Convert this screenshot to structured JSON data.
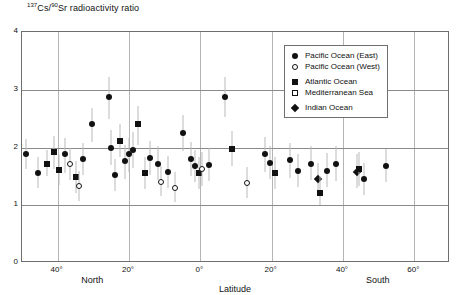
{
  "chart_data": {
    "type": "scatter",
    "title": "137Cs/90Sr radioactivity ratio",
    "title_parts": {
      "sup1": "137",
      "iso1": "Cs/",
      "sup2": "90",
      "iso2": "Sr radioactivity ratio"
    },
    "xlabel": "Latitude",
    "ylabel": "",
    "xlim": [
      50,
      -70
    ],
    "ylim": [
      0,
      4
    ],
    "grid": true,
    "y_ticks": [
      4,
      3,
      2,
      1,
      0
    ],
    "y_tick_labels": [
      "4",
      "3",
      "2",
      "1",
      "0"
    ],
    "x_ticks": [
      40,
      20,
      0,
      -20,
      -40,
      -60
    ],
    "x_tick_labels": [
      "40°",
      "20°",
      "0°",
      "20°",
      "40°",
      "60°"
    ],
    "hemisphere_labels": [
      {
        "text": "North",
        "x": 30
      },
      {
        "text": "South",
        "x": -50
      }
    ],
    "legend": {
      "position": "upper-right",
      "entries": [
        {
          "label": "Pacific Ocean (East)",
          "marker": "circle-filled"
        },
        {
          "label": "Pacific Ocean (West)",
          "marker": "circle-open"
        },
        {
          "label": "Atlantic Ocean",
          "marker": "square-filled"
        },
        {
          "label": "Mediterranean Sea",
          "marker": "square-open"
        },
        {
          "label": "Indian Ocean",
          "marker": "diamond-filled"
        }
      ]
    },
    "points": [
      {
        "x": 49.0,
        "y": 1.88,
        "lo": 1.62,
        "hi": 2.14,
        "marker": "circle-filled"
      },
      {
        "x": 45.5,
        "y": 1.56,
        "lo": 1.3,
        "hi": 1.84,
        "marker": "circle-filled"
      },
      {
        "x": 43.0,
        "y": 1.72,
        "lo": 1.5,
        "hi": 1.96,
        "marker": "square-filled"
      },
      {
        "x": 41.0,
        "y": 1.93,
        "lo": 1.62,
        "hi": 2.2,
        "marker": "square-filled"
      },
      {
        "x": 39.5,
        "y": 1.61,
        "lo": 1.35,
        "hi": 1.88,
        "marker": "square-filled"
      },
      {
        "x": 38.0,
        "y": 1.88,
        "lo": 1.56,
        "hi": 2.16,
        "marker": "circle-filled"
      },
      {
        "x": 36.5,
        "y": 1.72,
        "lo": 1.44,
        "hi": 2.0,
        "marker": "circle-open"
      },
      {
        "x": 35.0,
        "y": 1.49,
        "lo": 1.22,
        "hi": 1.76,
        "marker": "square-filled"
      },
      {
        "x": 33.0,
        "y": 1.8,
        "lo": 1.52,
        "hi": 2.08,
        "marker": "circle-filled"
      },
      {
        "x": 34.0,
        "y": 1.33,
        "lo": 1.08,
        "hi": 1.6,
        "marker": "circle-open"
      },
      {
        "x": 30.5,
        "y": 2.4,
        "lo": 2.1,
        "hi": 2.68,
        "marker": "circle-filled"
      },
      {
        "x": 25.5,
        "y": 2.88,
        "lo": 2.5,
        "hi": 3.22,
        "marker": "circle-filled"
      },
      {
        "x": 25.0,
        "y": 2.0,
        "lo": 1.7,
        "hi": 2.3,
        "marker": "circle-filled"
      },
      {
        "x": 24.0,
        "y": 1.52,
        "lo": 1.25,
        "hi": 1.8,
        "marker": "circle-filled"
      },
      {
        "x": 22.5,
        "y": 2.12,
        "lo": 1.84,
        "hi": 2.4,
        "marker": "square-filled"
      },
      {
        "x": 21.0,
        "y": 1.76,
        "lo": 1.46,
        "hi": 2.05,
        "marker": "circle-filled"
      },
      {
        "x": 20.0,
        "y": 1.88,
        "lo": 1.58,
        "hi": 2.16,
        "marker": "circle-filled"
      },
      {
        "x": 19.0,
        "y": 1.95,
        "lo": 1.64,
        "hi": 2.26,
        "marker": "circle-filled"
      },
      {
        "x": 17.5,
        "y": 2.4,
        "lo": 2.05,
        "hi": 2.72,
        "marker": "square-filled"
      },
      {
        "x": 15.5,
        "y": 1.55,
        "lo": 1.28,
        "hi": 1.84,
        "marker": "square-filled"
      },
      {
        "x": 14.0,
        "y": 1.82,
        "lo": 1.52,
        "hi": 2.12,
        "marker": "circle-filled"
      },
      {
        "x": 12.0,
        "y": 1.72,
        "lo": 1.44,
        "hi": 2.02,
        "marker": "circle-filled"
      },
      {
        "x": 11.0,
        "y": 1.41,
        "lo": 1.16,
        "hi": 1.68,
        "marker": "circle-open"
      },
      {
        "x": 9.0,
        "y": 1.58,
        "lo": 1.3,
        "hi": 1.86,
        "marker": "circle-filled"
      },
      {
        "x": 7.0,
        "y": 1.3,
        "lo": 1.05,
        "hi": 1.58,
        "marker": "circle-open"
      },
      {
        "x": 5.0,
        "y": 2.25,
        "lo": 1.94,
        "hi": 2.56,
        "marker": "circle-filled"
      },
      {
        "x": 2.5,
        "y": 1.8,
        "lo": 1.5,
        "hi": 2.1,
        "marker": "circle-filled"
      },
      {
        "x": 1.5,
        "y": 1.68,
        "lo": 1.4,
        "hi": 1.96,
        "marker": "circle-filled"
      },
      {
        "x": 0.5,
        "y": 1.56,
        "lo": 1.28,
        "hi": 1.84,
        "marker": "square-filled"
      },
      {
        "x": -0.5,
        "y": 1.62,
        "lo": 1.34,
        "hi": 1.92,
        "marker": "circle-open"
      },
      {
        "x": -2.5,
        "y": 1.7,
        "lo": 1.42,
        "hi": 1.99,
        "marker": "circle-filled"
      },
      {
        "x": -7.0,
        "y": 2.88,
        "lo": 2.52,
        "hi": 3.22,
        "marker": "circle-filled"
      },
      {
        "x": -9.0,
        "y": 1.98,
        "lo": 1.68,
        "hi": 2.28,
        "marker": "square-filled"
      },
      {
        "x": -13.0,
        "y": 1.38,
        "lo": 1.12,
        "hi": 1.66,
        "marker": "circle-open"
      },
      {
        "x": -18.0,
        "y": 1.88,
        "lo": 1.58,
        "hi": 2.18,
        "marker": "circle-filled"
      },
      {
        "x": -19.5,
        "y": 1.74,
        "lo": 1.46,
        "hi": 2.02,
        "marker": "circle-filled"
      },
      {
        "x": -21.0,
        "y": 1.55,
        "lo": 1.28,
        "hi": 1.84,
        "marker": "square-filled"
      },
      {
        "x": -25.0,
        "y": 1.78,
        "lo": 1.48,
        "hi": 2.08,
        "marker": "circle-filled"
      },
      {
        "x": -27.5,
        "y": 1.6,
        "lo": 1.32,
        "hi": 1.88,
        "marker": "circle-filled"
      },
      {
        "x": -31.0,
        "y": 1.72,
        "lo": 1.44,
        "hi": 2.02,
        "marker": "circle-filled"
      },
      {
        "x": -33.0,
        "y": 1.45,
        "lo": 1.18,
        "hi": 1.74,
        "marker": "diamond-filled"
      },
      {
        "x": -33.5,
        "y": 1.22,
        "lo": 1.0,
        "hi": 1.5,
        "marker": "square-filled"
      },
      {
        "x": -35.5,
        "y": 1.6,
        "lo": 1.32,
        "hi": 1.9,
        "marker": "circle-filled"
      },
      {
        "x": -38.0,
        "y": 1.72,
        "lo": 1.42,
        "hi": 2.02,
        "marker": "circle-filled"
      },
      {
        "x": -44.0,
        "y": 1.58,
        "lo": 1.3,
        "hi": 1.88,
        "marker": "diamond-filled"
      },
      {
        "x": -44.5,
        "y": 1.62,
        "lo": 1.34,
        "hi": 1.92,
        "marker": "square-filled"
      },
      {
        "x": -46.0,
        "y": 1.45,
        "lo": 1.18,
        "hi": 1.74,
        "marker": "circle-filled"
      },
      {
        "x": -52.0,
        "y": 1.68,
        "lo": 1.4,
        "hi": 1.98,
        "marker": "circle-filled"
      }
    ]
  }
}
